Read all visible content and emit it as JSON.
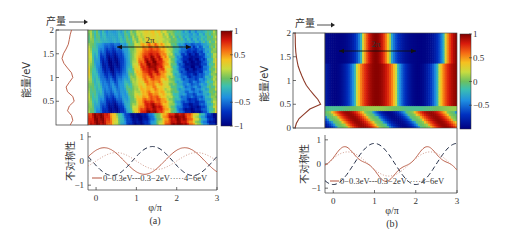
{
  "chart_data": [
    {
      "panel": "(a)",
      "type": "heatmap",
      "caption": "(a)",
      "yield_profile": {
        "label": "产量",
        "energy_eV": [
          0,
          0.1,
          0.2,
          0.3,
          0.4,
          0.5,
          0.6,
          0.7,
          0.8,
          0.9,
          1.0,
          1.1,
          1.2,
          1.3,
          1.4,
          1.5,
          1.6,
          1.7,
          1.8,
          1.9,
          2.0
        ],
        "yield": [
          0.45,
          0.55,
          0.5,
          0.35,
          0.42,
          0.6,
          0.55,
          0.35,
          0.3,
          0.42,
          0.55,
          0.5,
          0.35,
          0.22,
          0.15,
          0.2,
          0.3,
          0.38,
          0.42,
          0.45,
          0.5
        ]
      },
      "heatmap": {
        "xlim": [
          -0.2,
          3
        ],
        "ylim": [
          0,
          2
        ],
        "ylabel": "能量/eV",
        "yticks": [
          0.5,
          1,
          1.5,
          2
        ],
        "colorbar": {
          "ticks": [
            1,
            0.5,
            0,
            -0.5,
            -1
          ],
          "range": [
            -1,
            1
          ]
        },
        "annotation": {
          "text": "2π",
          "x_from": 0.2,
          "x_to": 2.2,
          "y": 1.55
        },
        "description": "Vertical stripes of asymmetry vs phase; blue stripes near φ=0.4π and 2.4π, red stripe near 1.4π for 0.3–2 eV; low-energy band (<0.3 eV) has opposite phase with red near 0, 2 and blue near 1"
      },
      "lineplot": {
        "type": "line",
        "xlabel": "φ/π",
        "ylabel": "不对称性",
        "xticks": [
          0,
          1,
          2,
          3
        ],
        "yticks": [
          -1,
          0,
          1
        ],
        "xlim": [
          -0.2,
          3
        ],
        "ylim": [
          -1.2,
          1.2
        ],
        "legend": [
          "0–0.3eV",
          "0.3–2eV",
          "4–6eV"
        ],
        "series": [
          {
            "name": "0–0.3eV",
            "style": "solid",
            "color": "#b5533c",
            "amplitude": 0.55,
            "peak_phase": 0.2
          },
          {
            "name": "0.3–2eV",
            "style": "dashed",
            "color": "#1f2a44",
            "amplitude": 0.6,
            "peak_phase": 1.4
          },
          {
            "name": "4–6eV",
            "style": "dotted",
            "color": "#c98f7f",
            "amplitude": 0.35,
            "peak_phase": 0.5
          }
        ]
      }
    },
    {
      "panel": "(b)",
      "type": "heatmap",
      "caption": "(b)",
      "yield_profile": {
        "label": "产量",
        "energy_eV": [
          0,
          0.1,
          0.2,
          0.3,
          0.4,
          0.5,
          0.6,
          0.7,
          0.8,
          0.9,
          1.0,
          1.1,
          1.2,
          1.3,
          1.4,
          1.5,
          1.6,
          1.7,
          1.8,
          1.9,
          2.0
        ],
        "yield": [
          0.0,
          0.05,
          0.15,
          0.35,
          0.55,
          0.95,
          0.85,
          0.7,
          0.55,
          0.42,
          0.33,
          0.25,
          0.18,
          0.12,
          0.08,
          0.05,
          0.03,
          0.02,
          0.01,
          0.01,
          0.0
        ]
      },
      "heatmap": {
        "xlim": [
          -0.2,
          3
        ],
        "ylim": [
          0,
          2
        ],
        "ylabel": "能量/eV",
        "yticks": [
          0,
          0.5,
          1,
          1.5,
          2
        ],
        "colorbar": {
          "ticks": [
            1,
            0.5,
            0,
            -0.5
          ],
          "range": [
            -1,
            1
          ]
        },
        "annotation": {
          "text": "2π",
          "x_from": 0.0,
          "x_to": 2.0,
          "y": 1.55
        },
        "description": "Strong vertical stripes: red near φ≈1π and 3π, blue near 0 and 2π for 0.4–2 eV; bottom band (<0.4 eV) shows tilted blobs with red near 0.3π, 2.3π and blue near 1.3π"
      },
      "lineplot": {
        "type": "line",
        "xlabel": "φ/π",
        "ylabel": "不对称性",
        "xticks": [
          0,
          1,
          2,
          3
        ],
        "yticks": [
          -1,
          0,
          1
        ],
        "xlim": [
          -0.2,
          3
        ],
        "ylim": [
          -1.2,
          1.2
        ],
        "legend": [
          "0–0.3eV",
          "0.3–2eV",
          "4–6eV"
        ],
        "series": [
          {
            "name": "0–0.3eV",
            "style": "solid",
            "color": "#b5533c",
            "amplitude": 0.6,
            "peak_phase": 0.3
          },
          {
            "name": "0.3–2eV",
            "style": "dashed",
            "color": "#1f2a44",
            "amplitude": 0.85,
            "peak_phase": 1.0
          },
          {
            "name": "4–6eV",
            "style": "dotted",
            "color": "#c98f7f",
            "amplitude": 0.5,
            "peak_phase": 0.35
          }
        ]
      }
    }
  ],
  "labels": {
    "yield_label": "产量",
    "energy_label": "能量/eV",
    "asym_label": "不对称性",
    "phi_label": "φ/π",
    "two_pi": "2π",
    "legend_a": "0−0.3eV---0.3−2eV·····4−6eV",
    "legend_b": "0−0.3eV---0.3−2eV·····4−6eV",
    "caption_a": "(a)",
    "caption_b": "(b)"
  }
}
